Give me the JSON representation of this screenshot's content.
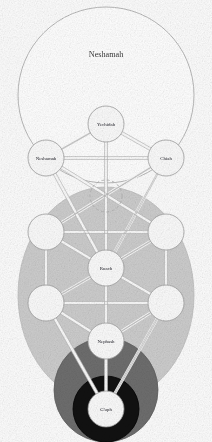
{
  "diagram": {
    "viewbox": "0 0 212 442",
    "background_color": "#fdfdfd"
  },
  "regions": [
    {
      "id": "neshamah-region",
      "label": "Neshamah",
      "shape": "circle",
      "cx": 106,
      "cy": 95,
      "r": 88,
      "fill": "#ffffff",
      "stroke": "#a8a8a8",
      "label_x": 106,
      "label_y": 57
    },
    {
      "id": "ruach-region",
      "label": "Ruach",
      "shape": "ellipse",
      "cx": 106,
      "cy": 295,
      "rx": 88,
      "ry": 108,
      "fill": "#cdcdcd",
      "stroke": "#bdbdbd",
      "label_x": 106,
      "label_y": 0
    },
    {
      "id": "nephash-region",
      "label": "Nephash",
      "shape": "circle",
      "cx": 106,
      "cy": 390,
      "r": 52,
      "fill": "#6e6e6e",
      "stroke": "#5f5f5f",
      "label_x": 106,
      "label_y": 0
    },
    {
      "id": "guph-region",
      "label": "G'uph",
      "shape": "circle",
      "cx": 106,
      "cy": 409,
      "r": 33,
      "fill": "#111111",
      "stroke": "#000000",
      "label_x": 106,
      "label_y": 0
    }
  ],
  "sephirot": [
    {
      "id": "keter",
      "label": "Yechidah",
      "cx": 106,
      "cy": 124,
      "r": 18,
      "label_fill": "dark"
    },
    {
      "id": "chokhmah",
      "label": "Chiah",
      "cx": 166,
      "cy": 158,
      "r": 18,
      "label_fill": "dark"
    },
    {
      "id": "binah",
      "label": "Neshamah",
      "cx": 46,
      "cy": 158,
      "r": 18,
      "label_fill": "dark"
    },
    {
      "id": "chesed",
      "label": "",
      "cx": 46,
      "cy": 232,
      "r": 18,
      "label_fill": "dark"
    },
    {
      "id": "gevurah",
      "label": "",
      "cx": 166,
      "cy": 232,
      "r": 18,
      "label_fill": "dark"
    },
    {
      "id": "tiferet",
      "label": "Ruach",
      "cx": 106,
      "cy": 268,
      "r": 18,
      "label_fill": "dark"
    },
    {
      "id": "netzach",
      "label": "",
      "cx": 46,
      "cy": 303,
      "r": 18,
      "label_fill": "dark"
    },
    {
      "id": "hod",
      "label": "",
      "cx": 166,
      "cy": 303,
      "r": 18,
      "label_fill": "dark"
    },
    {
      "id": "yesod",
      "label": "Nephash",
      "cx": 106,
      "cy": 341,
      "r": 18,
      "label_fill": "dark"
    },
    {
      "id": "malkhut",
      "label": "G'uph",
      "cx": 106,
      "cy": 409,
      "r": 18,
      "label_fill": "dark"
    }
  ],
  "daath": {
    "id": "daath",
    "label": "",
    "cx": 106,
    "cy": 196,
    "r": 16,
    "stroke": "#b0b0b0",
    "dash": "3 2.4"
  },
  "paths": [
    {
      "from": "keter",
      "to": "chokhmah"
    },
    {
      "from": "keter",
      "to": "binah"
    },
    {
      "from": "keter",
      "to": "tiferet"
    },
    {
      "from": "chokhmah",
      "to": "binah"
    },
    {
      "from": "chokhmah",
      "to": "chesed"
    },
    {
      "from": "chokhmah",
      "to": "tiferet"
    },
    {
      "from": "binah",
      "to": "gevurah"
    },
    {
      "from": "binah",
      "to": "tiferet"
    },
    {
      "from": "chesed",
      "to": "gevurah"
    },
    {
      "from": "chesed",
      "to": "tiferet"
    },
    {
      "from": "chesed",
      "to": "netzach"
    },
    {
      "from": "gevurah",
      "to": "tiferet"
    },
    {
      "from": "gevurah",
      "to": "hod"
    },
    {
      "from": "tiferet",
      "to": "netzach"
    },
    {
      "from": "tiferet",
      "to": "hod"
    },
    {
      "from": "tiferet",
      "to": "yesod"
    },
    {
      "from": "netzach",
      "to": "hod"
    },
    {
      "from": "netzach",
      "to": "yesod"
    },
    {
      "from": "netzach",
      "to": "malkhut"
    },
    {
      "from": "hod",
      "to": "yesod"
    },
    {
      "from": "hod",
      "to": "malkhut"
    },
    {
      "from": "yesod",
      "to": "malkhut"
    }
  ],
  "colors": {
    "paper": "#fdfdfd",
    "line": "#b9b9b9",
    "node_fill": "#fbfbfb",
    "node_stroke": "#9a9a9a",
    "light_gray": "#cdcdcd",
    "mid_gray": "#6e6e6e",
    "black": "#111111",
    "text": "#23232b"
  }
}
